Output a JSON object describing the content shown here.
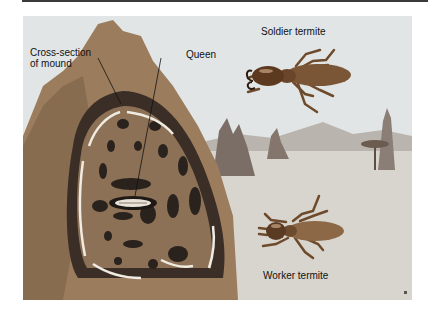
{
  "figure": {
    "labels": {
      "cross_section": [
        "Cross-section",
        "of mound"
      ],
      "queen": "Queen",
      "soldier": "Soldier termite",
      "worker": "Worker termite"
    }
  },
  "colors": {
    "sky": "#dfe3e4",
    "ground": "#d6d4cc",
    "mound_outer": "#9c7d5e",
    "mound_inner": "#8a6a4e",
    "chamber": "#2b2420",
    "arrow": "#f2efe6",
    "termite_body": "#7a5434",
    "termite_head": "#5a3a22",
    "distant_mound": "#7d7068",
    "hills": "#b7b3ad",
    "label_text": "#111111",
    "top_bar": "#3a3a3a"
  }
}
